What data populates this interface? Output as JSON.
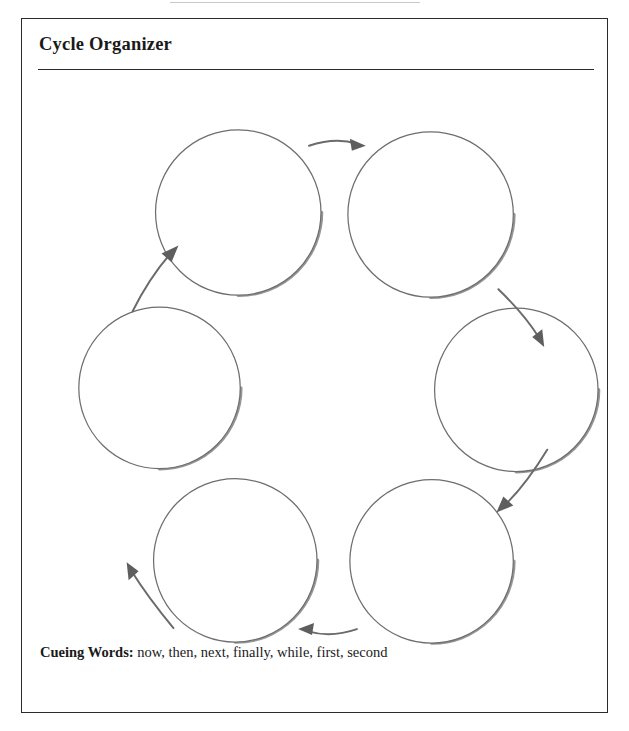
{
  "worksheet": {
    "title": "Cycle Organizer",
    "frame_border_color": "#2b2b2b",
    "page_background": "#ffffff"
  },
  "diagram": {
    "type": "cycle",
    "direction": "clockwise",
    "node_count": 6,
    "node_fill": "#ffffff",
    "node_stroke": "#6e6e6e",
    "arrow_color": "#6b6b6b",
    "nodes": [
      {
        "id": "node-1",
        "position": "top-left",
        "label": "",
        "cx": 217,
        "cy": 131,
        "r": 83
      },
      {
        "id": "node-2",
        "position": "top-right",
        "label": "",
        "cx": 410,
        "cy": 133,
        "r": 83
      },
      {
        "id": "node-3",
        "position": "right",
        "label": "",
        "cx": 496,
        "cy": 309,
        "r": 82
      },
      {
        "id": "node-4",
        "position": "bottom-right",
        "label": "",
        "cx": 411,
        "cy": 481,
        "r": 82
      },
      {
        "id": "node-5",
        "position": "bottom-left",
        "label": "",
        "cx": 214,
        "cy": 480,
        "r": 82
      },
      {
        "id": "node-6",
        "position": "left",
        "label": "",
        "cx": 138,
        "cy": 307,
        "r": 81
      }
    ],
    "arrows": [
      {
        "id": "arrow-1",
        "from": "node-1",
        "to": "node-2",
        "direction": "right"
      },
      {
        "id": "arrow-2",
        "from": "node-2",
        "to": "node-3",
        "direction": "down-right"
      },
      {
        "id": "arrow-3",
        "from": "node-3",
        "to": "node-4",
        "direction": "down-left"
      },
      {
        "id": "arrow-4",
        "from": "node-4",
        "to": "node-5",
        "direction": "left"
      },
      {
        "id": "arrow-5",
        "from": "node-5",
        "to": "node-6",
        "direction": "up-left"
      },
      {
        "id": "arrow-6",
        "from": "node-6",
        "to": "node-1",
        "direction": "up-right"
      }
    ]
  },
  "footer": {
    "cueing_label": "Cueing Words:",
    "cueing_words": " now, then, next, finally, while, first, second"
  }
}
